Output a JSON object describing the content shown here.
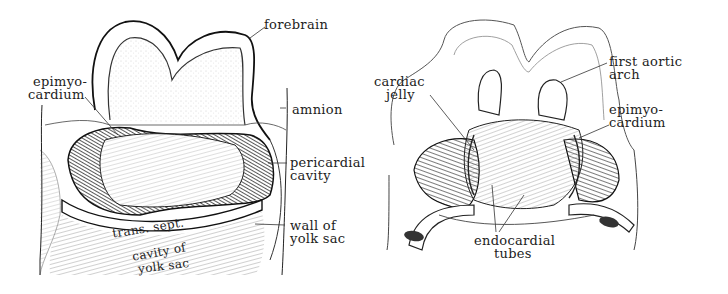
{
  "figures": [
    {
      "id": "left",
      "description": "Transverse section of embryo showing pericardial cavity (epimyocardium stage)",
      "labels": {
        "forebrain": "forebrain",
        "epimyocardium_1": "epimyo-",
        "epimyocardium_2": "cardium",
        "amnion": "amnion",
        "pericardial_1": "pericardial",
        "pericardial_2": "cavity",
        "trans_sept": "trans. sept.",
        "wall_yolk_1": "wall of",
        "wall_yolk_2": "yolk sac",
        "cavity_yolk_1": "cavity of",
        "cavity_yolk_2": "yolk sac"
      }
    },
    {
      "id": "right",
      "description": "Dissection showing endocardial tubes and first aortic arch",
      "labels": {
        "first_aortic_1": "first aortic",
        "first_aortic_2": "arch",
        "cardiac_jelly_1": "cardiac",
        "cardiac_jelly_2": "jelly",
        "epimyocardium_1": "epimyo-",
        "epimyocardium_2": "cardium",
        "endocardial_1": "endocardial",
        "endocardial_2": "tubes"
      }
    }
  ],
  "colors": {
    "ink": "#1a1a1a",
    "shade_dark": "#2a2a2a",
    "stipple": "#e8e8e8",
    "background": "#ffffff"
  }
}
